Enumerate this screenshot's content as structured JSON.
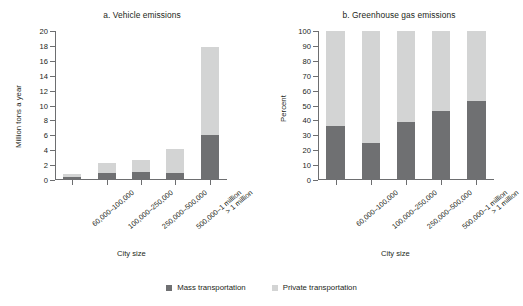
{
  "figure": {
    "legend": [
      {
        "label": "Mass transportation",
        "color": "#6f7072",
        "icon": "square-swatch-icon"
      },
      {
        "label": "Private transportation",
        "color": "#d3d4d4",
        "icon": "square-swatch-icon"
      }
    ]
  },
  "chart_data": [
    {
      "type": "bar",
      "title": "a. Vehicle emissions",
      "xlabel": "City size",
      "ylabel": "Million tons a year",
      "ylim": [
        0,
        20
      ],
      "yticks": [
        0,
        2,
        4,
        6,
        8,
        10,
        12,
        14,
        16,
        18,
        20
      ],
      "ytick_labels": [
        "0",
        "2",
        "4",
        "6",
        "8",
        "10",
        "12",
        "14",
        "16",
        "18",
        "20"
      ],
      "grid": false,
      "stacked": true,
      "legend_position": "bottom",
      "categories": [
        "60,000–100,000",
        "100,000–250,000",
        "250,000–500,000",
        "500,000–1 million",
        "> 1 million"
      ],
      "series": [
        {
          "name": "Mass transportation",
          "color": "#6f7072",
          "values": [
            0.4,
            1.0,
            1.1,
            0.9,
            6.1
          ]
        },
        {
          "name": "Private transportation",
          "color": "#d3d4d4",
          "values": [
            0.4,
            1.3,
            1.6,
            3.2,
            11.8
          ]
        }
      ],
      "totals": [
        0.8,
        2.3,
        2.7,
        4.1,
        17.9
      ]
    },
    {
      "type": "bar",
      "title": "b. Greenhouse gas emissions",
      "xlabel": "City size",
      "ylabel": "Percent",
      "ylim": [
        0,
        100
      ],
      "yticks": [
        0,
        10,
        20,
        30,
        40,
        50,
        60,
        70,
        80,
        90,
        100
      ],
      "ytick_labels": [
        "0",
        "10",
        "20",
        "30",
        "40",
        "50",
        "60",
        "70",
        "80",
        "90",
        "100"
      ],
      "grid": false,
      "stacked": true,
      "legend_position": "bottom",
      "categories": [
        "60,000–100,000",
        "100,000–250,000",
        "250,000–500,000",
        "500,000–1 million",
        "> 1 million"
      ],
      "series": [
        {
          "name": "Mass transportation",
          "color": "#6f7072",
          "values": [
            36,
            25,
            39,
            46,
            53
          ]
        },
        {
          "name": "Private transportation",
          "color": "#d3d4d4",
          "values": [
            64,
            75,
            61,
            54,
            47
          ]
        }
      ],
      "totals": [
        100,
        100,
        100,
        100,
        100
      ]
    }
  ]
}
